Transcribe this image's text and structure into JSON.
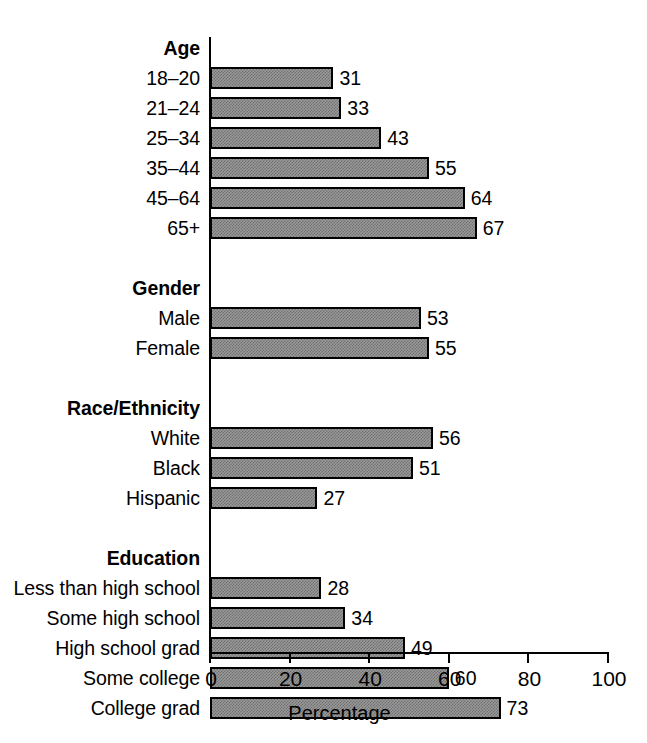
{
  "chart_data": {
    "type": "bar",
    "orientation": "horizontal",
    "title": "",
    "xlabel": "Percentage",
    "ylabel": "",
    "xlim": [
      0,
      100
    ],
    "xticks": [
      0,
      20,
      40,
      60,
      80,
      100
    ],
    "grid": false,
    "legend": null,
    "bar_color": "#9a9a9a",
    "bar_edge_color": "#000000",
    "categories": [
      "18–20",
      "21–24",
      "25–34",
      "35–44",
      "45–64",
      "65+",
      "Male",
      "Female",
      "White",
      "Black",
      "Hispanic",
      "Less than high school",
      "Some high school",
      "High school grad",
      "Some college",
      "College grad"
    ],
    "values": [
      31,
      33,
      43,
      55,
      64,
      67,
      53,
      55,
      56,
      51,
      27,
      28,
      34,
      49,
      60,
      73
    ],
    "group_headers": [
      "Age",
      "Gender",
      "Race/Ethnicity",
      "Education"
    ],
    "groups": [
      {
        "header": "Age",
        "items": [
          {
            "label": "18–20",
            "value": 31
          },
          {
            "label": "21–24",
            "value": 33
          },
          {
            "label": "25–34",
            "value": 43
          },
          {
            "label": "35–44",
            "value": 55
          },
          {
            "label": "45–64",
            "value": 64
          },
          {
            "label": "65+",
            "value": 67
          }
        ]
      },
      {
        "header": "Gender",
        "items": [
          {
            "label": "Male",
            "value": 53
          },
          {
            "label": "Female",
            "value": 55
          }
        ]
      },
      {
        "header": "Race/Ethnicity",
        "items": [
          {
            "label": "White",
            "value": 56
          },
          {
            "label": "Black",
            "value": 51
          },
          {
            "label": "Hispanic",
            "value": 27
          }
        ]
      },
      {
        "header": "Education",
        "items": [
          {
            "label": "Less than high school",
            "value": 28
          },
          {
            "label": "Some high school",
            "value": 34
          },
          {
            "label": "High school grad",
            "value": 49
          },
          {
            "label": "Some college",
            "value": 60
          },
          {
            "label": "College grad",
            "value": 73
          }
        ]
      }
    ]
  },
  "rows": [
    {
      "label": "Age",
      "type": "header",
      "value": null
    },
    {
      "label": "18–20",
      "type": "bar",
      "value": 31
    },
    {
      "label": "21–24",
      "type": "bar",
      "value": 33
    },
    {
      "label": "25–34",
      "type": "bar",
      "value": 43
    },
    {
      "label": "35–44",
      "type": "bar",
      "value": 55
    },
    {
      "label": "45–64",
      "type": "bar",
      "value": 64
    },
    {
      "label": "65+",
      "type": "bar",
      "value": 67
    },
    {
      "label": "",
      "type": "spacer",
      "value": null
    },
    {
      "label": "Gender",
      "type": "header",
      "value": null
    },
    {
      "label": "Male",
      "type": "bar",
      "value": 53
    },
    {
      "label": "Female",
      "type": "bar",
      "value": 55
    },
    {
      "label": "",
      "type": "spacer",
      "value": null
    },
    {
      "label": "Race/Ethnicity",
      "type": "header",
      "value": null
    },
    {
      "label": "White",
      "type": "bar",
      "value": 56
    },
    {
      "label": "Black",
      "type": "bar",
      "value": 51
    },
    {
      "label": "Hispanic",
      "type": "bar",
      "value": 27
    },
    {
      "label": "",
      "type": "spacer",
      "value": null
    },
    {
      "label": "Education",
      "type": "header",
      "value": null
    },
    {
      "label": "Less than high school",
      "type": "bar",
      "value": 28
    },
    {
      "label": "Some high school",
      "type": "bar",
      "value": 34
    },
    {
      "label": "High school grad",
      "type": "bar",
      "value": 49
    },
    {
      "label": "Some college",
      "type": "bar",
      "value": 60
    },
    {
      "label": "College grad",
      "type": "bar",
      "value": 73
    }
  ],
  "axis": {
    "x_title": "Percentage",
    "ticks": [
      "0",
      "20",
      "40",
      "60",
      "80",
      "100"
    ]
  }
}
